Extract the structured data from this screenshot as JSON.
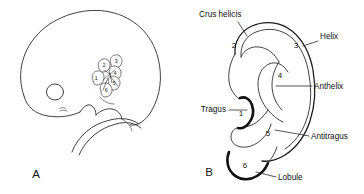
{
  "figure": {
    "panels": [
      {
        "id": "A",
        "letter": "A",
        "caption": "Embryo head in profile showing the six auricular hillocks around the first pharyngeal groove",
        "subject": "embryo-head-profile"
      },
      {
        "id": "B",
        "letter": "B",
        "caption": "Adult auricle showing derivatives of the six hillocks",
        "subject": "adult-auricle"
      }
    ]
  },
  "hillocks": {
    "panel_a_numbers": [
      "1",
      "2",
      "3",
      "4",
      "5",
      "6"
    ],
    "panel_b_numbers": [
      "1",
      "2",
      "3",
      "4",
      "5",
      "6"
    ]
  },
  "labels": {
    "crus_helicis": "Crus helicis",
    "helix": "Helix",
    "anthelix": "Anthelix",
    "tragus": "Tragus",
    "antitragus": "Antitragus",
    "lobule": "Lobule"
  },
  "numbers": {
    "n1": "1",
    "n2": "2",
    "n3": "3",
    "n4": "4",
    "n5": "5",
    "n6": "6"
  },
  "colors": {
    "ink": "#2b2b2b",
    "heavy_ink": "#111111",
    "background": "#ffffff",
    "stipple": "#8d8d8d"
  }
}
